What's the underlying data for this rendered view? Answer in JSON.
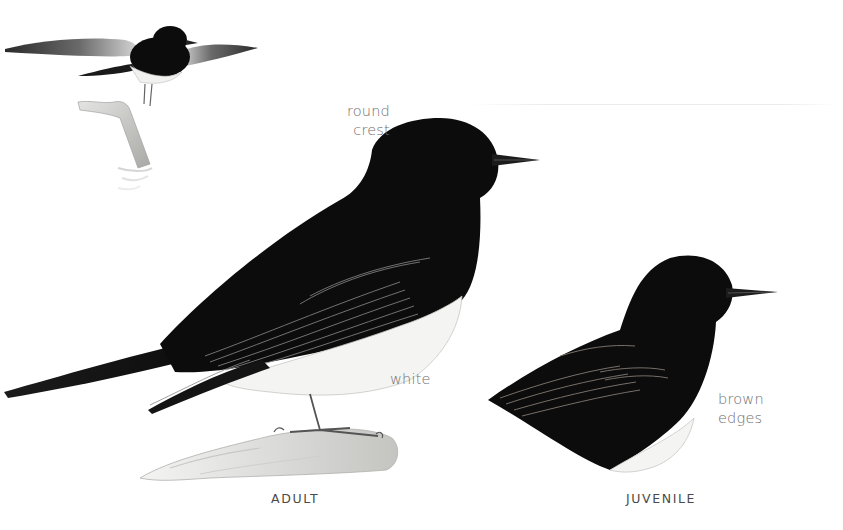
{
  "figure": {
    "captions": {
      "adult": "ADULT",
      "juvenile": "JUVENILE"
    },
    "annotations": {
      "crest": "round\ncrest",
      "belly": "white",
      "juvenile_wing": "brown\nedges"
    },
    "illustrations": [
      {
        "id": "flying-adult",
        "pose": "in flight above perch"
      },
      {
        "id": "perched-adult",
        "pose": "perched on branch"
      },
      {
        "id": "juvenile",
        "pose": "cropped upper body"
      }
    ],
    "colors": {
      "plumage_black": "#0c0c0c",
      "belly_white": "#f4f4f2",
      "wing_edge_grey": "#8a8a8a",
      "label_grey": "#6e6e6e",
      "caption_grey": "#4a4a4a",
      "perch_grey": "#c9c9c6"
    }
  }
}
